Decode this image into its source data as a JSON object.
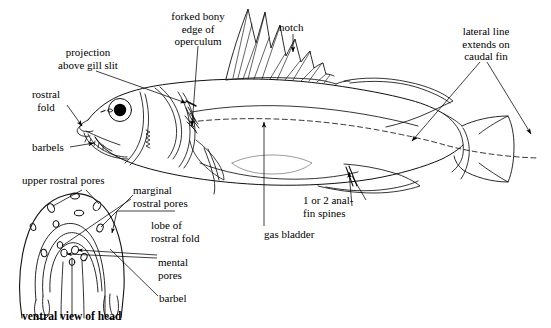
{
  "figure": {
    "title_caption": "ventral view of head",
    "ink_color": "#000000",
    "background_color": "#ffffff",
    "lateral_line_style": "dashed"
  },
  "labels": {
    "forked_bony_edge": "forked bony\nedge of\noperculum",
    "notch": "notch",
    "lateral_line": "lateral line\nextends on\ncaudal fin",
    "projection": "projection\nabove gill slit",
    "rostral_fold": "rostral\nfold",
    "barbels": "barbels",
    "upper_rostral_pores": "upper rostral pores",
    "marginal_rostral_pores": "marginal\nrostral pores",
    "lobe_of_rostral_fold": "lobe of\nrostral fold",
    "mental_pores": "mental\npores",
    "barbel": "barbel",
    "anal_fin_spines": "1 or 2 anal-\nfin spines",
    "gas_bladder": "gas bladder",
    "ventral_view": "ventral view of head"
  },
  "icons": {
    "notch_arrow": "down-arrow-icon",
    "leader_arrow": "arrow-leader-icon"
  }
}
